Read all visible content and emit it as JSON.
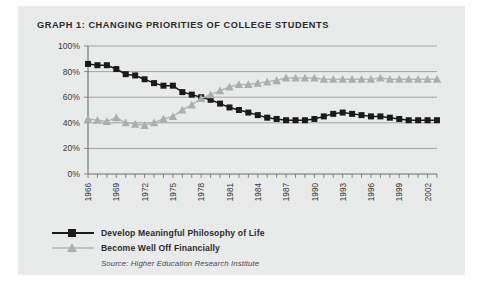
{
  "figure": {
    "title": "GRAPH 1: CHANGING PRIORITIES OF COLLEGE STUDENTS",
    "source_note": "Source: Higher Education Research Institute",
    "panel_bg": "#e9eaea"
  },
  "legend": {
    "position": "below-plot",
    "items": [
      {
        "label": "Develop Meaningful Philosophy of Life",
        "color": "#1a1a1a",
        "marker": "square"
      },
      {
        "label": "Become Well Off Financially",
        "color": "#adafaf",
        "marker": "triangle"
      }
    ]
  },
  "chart_data": {
    "type": "line",
    "title": "GRAPH 1: CHANGING PRIORITIES OF COLLEGE STUDENTS",
    "xlabel": "",
    "ylabel": "",
    "ylim": [
      0,
      100
    ],
    "ytick_values": [
      0,
      20,
      40,
      60,
      80,
      100
    ],
    "ytick_labels": [
      "0%",
      "20%",
      "40%",
      "60%",
      "80%",
      "100%"
    ],
    "grid": true,
    "xlim": [
      1966,
      2003
    ],
    "x": [
      1966,
      1967,
      1968,
      1969,
      1970,
      1971,
      1972,
      1973,
      1974,
      1975,
      1976,
      1977,
      1978,
      1979,
      1980,
      1981,
      1982,
      1983,
      1984,
      1985,
      1986,
      1987,
      1988,
      1989,
      1990,
      1991,
      1992,
      1993,
      1994,
      1995,
      1996,
      1997,
      1998,
      1999,
      2000,
      2001,
      2002,
      2003
    ],
    "xtick_labels_shown": [
      "1966",
      "1969",
      "1972",
      "1975",
      "1978",
      "1981",
      "1984",
      "1987",
      "1990",
      "1993",
      "1996",
      "1999",
      "2002"
    ],
    "xtick_label_rotation": 90,
    "series": [
      {
        "name": "Develop Meaningful Philosophy of Life",
        "color": "#1a1a1a",
        "marker": "square",
        "values": [
          86,
          85,
          85,
          82,
          78,
          77,
          74,
          71,
          69,
          69,
          64,
          62,
          60,
          58,
          55,
          52,
          50,
          48,
          46,
          44,
          43,
          42,
          42,
          42,
          43,
          45,
          47,
          48,
          47,
          46,
          45,
          45,
          44,
          43,
          42,
          42,
          42,
          42
        ]
      },
      {
        "name": "Become Well Off Financially",
        "color": "#adafaf",
        "marker": "triangle",
        "values": [
          43,
          42,
          41,
          44,
          40,
          39,
          38,
          40,
          43,
          45,
          50,
          54,
          59,
          62,
          65,
          68,
          70,
          70,
          71,
          72,
          73,
          75,
          75,
          75,
          75,
          74,
          74,
          74,
          74,
          74,
          74,
          75,
          74,
          74,
          74,
          74,
          74,
          74
        ]
      }
    ]
  }
}
